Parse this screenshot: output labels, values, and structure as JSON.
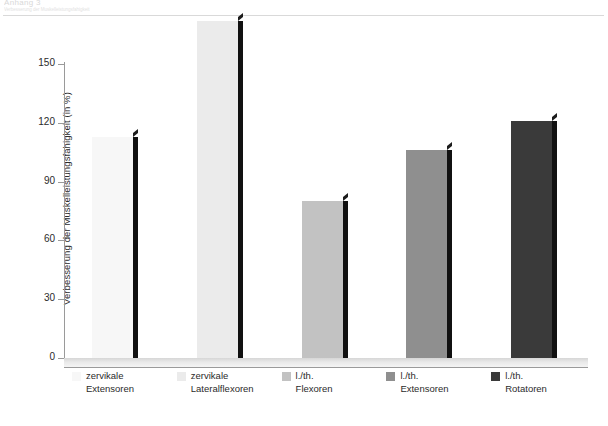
{
  "header": {
    "title": "Anhang 3",
    "subtitle": "Verbesserung der Muskelleistungsfahigkeit"
  },
  "chart_data": {
    "type": "bar",
    "title": "",
    "xlabel": "",
    "ylabel": "Verbesserung der Muskelleistungsfähigkeit (in %)",
    "ylim": [
      0,
      175
    ],
    "yticks": [
      0,
      30,
      60,
      90,
      120,
      150
    ],
    "grid": false,
    "legend_position": "bottom",
    "categories": [
      "zervikale Extensoren",
      "zervikale Lateralflexoren",
      "l./th. Flexoren",
      "l./th. Extensoren",
      "l./th. Rotatoren"
    ],
    "category_lines": [
      [
        "zervikale",
        "Extensoren"
      ],
      [
        "zervikale",
        "Lateralflexoren"
      ],
      [
        "l./th.",
        "Flexoren"
      ],
      [
        "l./th.",
        "Extensoren"
      ],
      [
        "l./th.",
        "Rotatoren"
      ]
    ],
    "values": [
      113,
      172,
      80,
      106,
      121
    ],
    "colors": [
      "#f7f7f7",
      "#ebebeb",
      "#c2c2c2",
      "#8f8f8f",
      "#3a3a3a"
    ],
    "bar_side_color": "#111111",
    "axis_color": "#9a9a9a",
    "text_color": "#2b2b2b",
    "background": "#ffffff"
  }
}
